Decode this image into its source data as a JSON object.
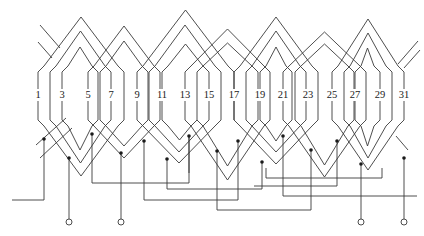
{
  "diagram": {
    "type": "stator winding developed diagram",
    "slot_labels": [
      "1",
      "3",
      "5",
      "7",
      "9",
      "11",
      "13",
      "15",
      "17",
      "19",
      "21",
      "23",
      "25",
      "27",
      "29",
      "31"
    ],
    "slot_label_x": [
      38,
      62,
      88,
      111,
      137,
      162,
      185,
      209,
      234,
      260,
      283,
      308,
      332,
      355,
      380,
      404
    ],
    "slot_label_y": 96,
    "conductor_top_y": 72,
    "conductor_bottom_y": 120,
    "coil_groups": [
      {
        "left": 38,
        "right": 124,
        "apex_y": 17
      },
      {
        "left": 50,
        "right": 111,
        "apex_y": 31
      },
      {
        "left": 62,
        "right": 98,
        "apex_y": 47
      },
      {
        "left": 88,
        "right": 160,
        "apex_y": 26
      },
      {
        "left": 100,
        "right": 148,
        "apex_y": 41
      },
      {
        "left": 137,
        "right": 234,
        "apex_y": 10
      },
      {
        "left": 149,
        "right": 221,
        "apex_y": 25
      },
      {
        "left": 162,
        "right": 209,
        "apex_y": 44
      },
      {
        "left": 185,
        "right": 270,
        "apex_y": 29
      },
      {
        "left": 197,
        "right": 258,
        "apex_y": 43
      },
      {
        "left": 234,
        "right": 318,
        "apex_y": 17
      },
      {
        "left": 246,
        "right": 306,
        "apex_y": 31
      },
      {
        "left": 260,
        "right": 292,
        "apex_y": 47
      },
      {
        "left": 283,
        "right": 366,
        "apex_y": 32
      },
      {
        "left": 295,
        "right": 354,
        "apex_y": 44
      },
      {
        "left": 332,
        "right": 404,
        "apex_y": 19
      },
      {
        "left": 344,
        "right": 392,
        "apex_y": 33
      },
      {
        "left": 355,
        "right": 380,
        "apex_y": 48
      }
    ],
    "bottom_groups": [
      {
        "left": 38,
        "right": 124,
        "valley_y": 176
      },
      {
        "left": 50,
        "right": 111,
        "valley_y": 163
      },
      {
        "left": 62,
        "right": 98,
        "valley_y": 150
      },
      {
        "left": 88,
        "right": 160,
        "valley_y": 158
      },
      {
        "left": 100,
        "right": 148,
        "valley_y": 146
      },
      {
        "left": 137,
        "right": 221,
        "valley_y": 163
      },
      {
        "left": 149,
        "right": 209,
        "valley_y": 152
      },
      {
        "left": 162,
        "right": 197,
        "valley_y": 140
      },
      {
        "left": 185,
        "right": 270,
        "valley_y": 180
      },
      {
        "left": 197,
        "right": 258,
        "valley_y": 166
      },
      {
        "left": 234,
        "right": 318,
        "valley_y": 164
      },
      {
        "left": 246,
        "right": 306,
        "valley_y": 152
      },
      {
        "left": 260,
        "right": 292,
        "valley_y": 141
      },
      {
        "left": 283,
        "right": 366,
        "valley_y": 177
      },
      {
        "left": 295,
        "right": 354,
        "valley_y": 165
      },
      {
        "left": 332,
        "right": 404,
        "valley_y": 170
      },
      {
        "left": 344,
        "right": 392,
        "valley_y": 158
      },
      {
        "left": 355,
        "right": 380,
        "valley_y": 146
      }
    ],
    "stub_lines": [
      {
        "x1": 40,
        "y1": 25,
        "x2": 60,
        "y2": 48
      },
      {
        "x1": 38,
        "y1": 42,
        "x2": 52,
        "y2": 58
      },
      {
        "x1": 418,
        "y1": 41,
        "x2": 398,
        "y2": 64
      },
      {
        "x1": 420,
        "y1": 50,
        "x2": 404,
        "y2": 68
      },
      {
        "x1": 36,
        "y1": 145,
        "x2": 66,
        "y2": 118
      },
      {
        "x1": 40,
        "y1": 158,
        "x2": 72,
        "y2": 128
      },
      {
        "x1": 408,
        "y1": 150,
        "x2": 396,
        "y2": 136
      }
    ],
    "junction_dots": [
      {
        "x": 44,
        "y": 139
      },
      {
        "x": 69,
        "y": 158
      },
      {
        "x": 92,
        "y": 134
      },
      {
        "x": 121,
        "y": 153
      },
      {
        "x": 144,
        "y": 141
      },
      {
        "x": 167,
        "y": 159
      },
      {
        "x": 189,
        "y": 136
      },
      {
        "x": 217,
        "y": 151
      },
      {
        "x": 238,
        "y": 141
      },
      {
        "x": 262,
        "y": 162
      },
      {
        "x": 283,
        "y": 136
      },
      {
        "x": 311,
        "y": 150
      },
      {
        "x": 337,
        "y": 141
      },
      {
        "x": 361,
        "y": 164
      },
      {
        "x": 404,
        "y": 158
      }
    ],
    "leads": [
      {
        "points": "12,200 44,200 44,139"
      },
      {
        "points": "69,158 69,222"
      },
      {
        "points": "121,153 121,222"
      },
      {
        "points": "92,134 92,183 189,183 189,136"
      },
      {
        "points": "144,141 144,200 238,200 238,141"
      },
      {
        "points": "167,159 167,189 262,189 262,162"
      },
      {
        "points": "217,151 217,210 311,210 311,150"
      },
      {
        "points": "283,136 283,196 417,196"
      },
      {
        "points": "337,141 337,186 254,186"
      },
      {
        "points": "361,164 361,222"
      },
      {
        "points": "404,158 404,222"
      },
      {
        "points": "189,136 189,173"
      },
      {
        "points": "266,168 266,178 382,178 382,168"
      }
    ],
    "terminals": [
      {
        "x": 69,
        "y": 222,
        "r": 3
      },
      {
        "x": 121,
        "y": 222,
        "r": 3
      },
      {
        "x": 361,
        "y": 222,
        "r": 3
      },
      {
        "x": 404,
        "y": 222,
        "r": 3
      }
    ]
  }
}
